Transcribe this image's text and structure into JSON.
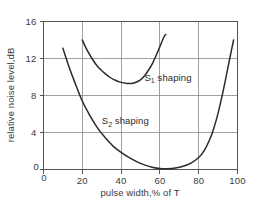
{
  "chart_data": {
    "type": "line",
    "title": "",
    "xlabel": "pulse width,% of T",
    "ylabel": "relative noise level,dB",
    "xlim": [
      0,
      100
    ],
    "ylim": [
      0,
      16
    ],
    "xticks": [
      0,
      20,
      40,
      60,
      80,
      100
    ],
    "yticks": [
      0,
      4,
      8,
      12,
      16
    ],
    "xtick_labels": [
      "0",
      "20",
      "40",
      "60",
      "80",
      "100"
    ],
    "ytick_labels": [
      "0",
      "4",
      "8",
      "12",
      "16"
    ],
    "grid": true,
    "grid_x": [
      20,
      40,
      60,
      80
    ],
    "grid_y": [
      4,
      8,
      12
    ],
    "legend_position": "inline-annotation",
    "series": [
      {
        "name": "S1 shaping",
        "label_main": "S",
        "label_sub": "1",
        "label_rest": " shaping",
        "label_x": 52,
        "label_y": 9.6,
        "color": "#2b2b2b",
        "x": [
          20,
          22,
          25,
          28,
          31,
          34,
          37,
          40,
          43,
          45,
          47,
          50,
          52,
          54,
          56,
          58,
          60,
          62,
          63
        ],
        "y": [
          14.0,
          13.1,
          12.0,
          11.1,
          10.5,
          10.0,
          9.65,
          9.42,
          9.31,
          9.3,
          9.38,
          9.7,
          10.1,
          10.7,
          11.4,
          12.3,
          13.3,
          14.3,
          14.6
        ]
      },
      {
        "name": "S2 shaping",
        "label_main": "S",
        "label_sub": "2",
        "label_rest": " shaping",
        "label_x": 30,
        "label_y": 4.9,
        "color": "#2b2b2b",
        "x": [
          10,
          13,
          16,
          20,
          24,
          28,
          32,
          36,
          40,
          44,
          48,
          52,
          56,
          60,
          64,
          68,
          72,
          76,
          80,
          83,
          86,
          88,
          90,
          92,
          94,
          96,
          98
        ],
        "y": [
          13.1,
          11.2,
          9.5,
          7.4,
          5.8,
          4.45,
          3.4,
          2.5,
          1.85,
          1.3,
          0.85,
          0.5,
          0.25,
          0.1,
          0.08,
          0.15,
          0.35,
          0.7,
          1.3,
          2.1,
          3.4,
          4.6,
          6.1,
          7.9,
          9.9,
          12.0,
          14.0
        ]
      }
    ]
  },
  "axes": {
    "y_axis_zero_label": "0",
    "x_axis_zero_label": "0"
  },
  "colors": {
    "curve": "#2b2b2b",
    "grid": "#8a8a8a",
    "frame": "#555555",
    "text": "#3a3a3a",
    "background": "#ffffff"
  }
}
